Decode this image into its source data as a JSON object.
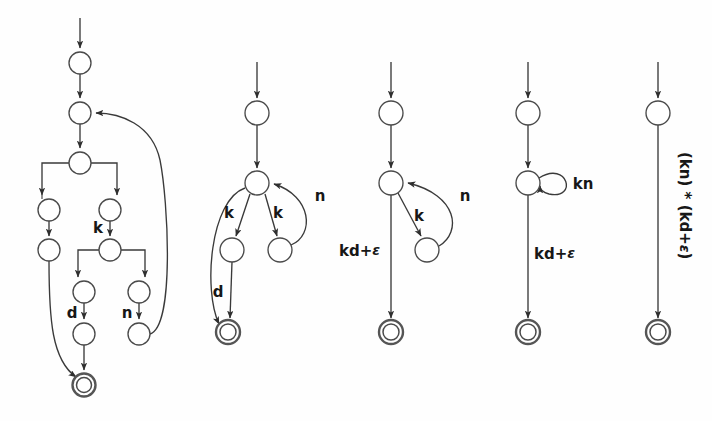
{
  "figure": {
    "background_color": "#fefefe",
    "stroke_color": "#3a3a3a",
    "label_color": "#171717",
    "width": 712,
    "height": 421
  },
  "automata": [
    {
      "id": "automaton-1",
      "caption": "",
      "states": [
        {
          "id": "a1-s0",
          "cx": 80,
          "cy": 63,
          "r": 11,
          "type": "normal"
        },
        {
          "id": "a1-s1",
          "cx": 80,
          "cy": 113,
          "r": 11,
          "type": "normal"
        },
        {
          "id": "a1-s2",
          "cx": 80,
          "cy": 163,
          "r": 11,
          "type": "normal"
        },
        {
          "id": "a1-s3",
          "cx": 49,
          "cy": 210,
          "r": 11,
          "type": "normal"
        },
        {
          "id": "a1-s4",
          "cx": 110,
          "cy": 210,
          "r": 11,
          "type": "normal"
        },
        {
          "id": "a1-s5",
          "cx": 49,
          "cy": 250,
          "r": 11,
          "type": "normal"
        },
        {
          "id": "a1-s6",
          "cx": 110,
          "cy": 250,
          "r": 11,
          "type": "normal"
        },
        {
          "id": "a1-s7",
          "cx": 84,
          "cy": 292,
          "r": 11,
          "type": "normal"
        },
        {
          "id": "a1-s8",
          "cx": 139,
          "cy": 292,
          "r": 11,
          "type": "normal"
        },
        {
          "id": "a1-s9",
          "cx": 84,
          "cy": 334,
          "r": 11,
          "type": "normal"
        },
        {
          "id": "a1-s10",
          "cx": 139,
          "cy": 334,
          "r": 11,
          "type": "normal"
        },
        {
          "id": "a1-acc",
          "cx": 84,
          "cy": 385,
          "r": 11,
          "type": "accept"
        }
      ],
      "edge_labels": [
        {
          "id": "a1-lab-k",
          "text": "k",
          "x": 98,
          "y": 228
        },
        {
          "id": "a1-lab-d",
          "text": "d",
          "x": 72,
          "y": 312
        },
        {
          "id": "a1-lab-n",
          "text": "n",
          "x": 127,
          "y": 312
        }
      ]
    },
    {
      "id": "automaton-2",
      "caption": "",
      "states": [
        {
          "id": "a2-s0",
          "cx": 257,
          "cy": 113,
          "r": 12,
          "type": "normal"
        },
        {
          "id": "a2-s1",
          "cx": 257,
          "cy": 183,
          "r": 12,
          "type": "normal"
        },
        {
          "id": "a2-s2",
          "cx": 232,
          "cy": 250,
          "r": 12,
          "type": "normal"
        },
        {
          "id": "a2-s3",
          "cx": 280,
          "cy": 250,
          "r": 12,
          "type": "normal"
        },
        {
          "id": "a2-acc",
          "cx": 228,
          "cy": 332,
          "r": 12,
          "type": "accept"
        }
      ],
      "edge_labels": [
        {
          "id": "a2-lab-k1",
          "text": "k",
          "x": 229,
          "y": 213
        },
        {
          "id": "a2-lab-k2",
          "text": "k",
          "x": 277,
          "y": 213
        },
        {
          "id": "a2-lab-n",
          "text": "n",
          "x": 320,
          "y": 196
        },
        {
          "id": "a2-lab-d",
          "text": "d",
          "x": 218,
          "y": 291
        }
      ]
    },
    {
      "id": "automaton-3",
      "caption": "",
      "states": [
        {
          "id": "a3-s0",
          "cx": 391,
          "cy": 113,
          "r": 12,
          "type": "normal"
        },
        {
          "id": "a3-s1",
          "cx": 391,
          "cy": 183,
          "r": 12,
          "type": "normal"
        },
        {
          "id": "a3-s2",
          "cx": 427,
          "cy": 250,
          "r": 12,
          "type": "normal"
        },
        {
          "id": "a3-acc",
          "cx": 391,
          "cy": 332,
          "r": 12,
          "type": "accept"
        }
      ],
      "edge_labels": [
        {
          "id": "a3-lab-k",
          "text": "k",
          "x": 419,
          "y": 216
        },
        {
          "id": "a3-lab-n",
          "text": "n",
          "x": 465,
          "y": 196
        },
        {
          "id": "a3-lab-kd",
          "text": "kd+",
          "epsilon": "ε",
          "x": 340,
          "y": 250
        }
      ]
    },
    {
      "id": "automaton-4",
      "caption": "",
      "states": [
        {
          "id": "a4-s0",
          "cx": 528,
          "cy": 113,
          "r": 12,
          "type": "normal"
        },
        {
          "id": "a4-s1",
          "cx": 528,
          "cy": 183,
          "r": 12,
          "type": "normal"
        },
        {
          "id": "a4-acc",
          "cx": 528,
          "cy": 332,
          "r": 12,
          "type": "accept"
        }
      ],
      "edge_labels": [
        {
          "id": "a4-lab-kn",
          "text": "kn",
          "x": 582,
          "y": 183
        },
        {
          "id": "a4-lab-kd",
          "text": "kd+",
          "epsilon": "ε",
          "x": 535,
          "y": 253
        }
      ]
    },
    {
      "id": "automaton-5",
      "caption": "",
      "states": [
        {
          "id": "a5-s0",
          "cx": 658,
          "cy": 113,
          "r": 12,
          "type": "normal"
        },
        {
          "id": "a5-acc",
          "cx": 658,
          "cy": 332,
          "r": 12,
          "type": "accept"
        }
      ],
      "edge_labels": [
        {
          "id": "a5-lab-expr",
          "text": "(kn) * (kd+",
          "epsilon": "ε",
          "tail": ")",
          "x": 678,
          "y": 150,
          "rotated": true
        }
      ]
    }
  ],
  "regex_result": "(kn) * (kd+ε)"
}
